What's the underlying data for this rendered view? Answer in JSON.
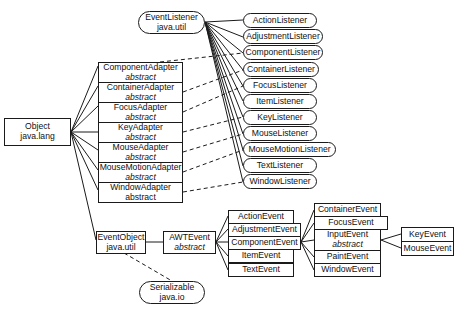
{
  "diagram": {
    "root": {
      "name": "Object",
      "package": "java.lang"
    },
    "event_listener": {
      "name": "EventListener",
      "package": "java.util"
    },
    "event_object": {
      "name": "EventObject",
      "package": "java.util"
    },
    "serializable": {
      "name": "Serializable",
      "package": "java.io"
    },
    "awt_event": {
      "name": "AWTEvent",
      "modifier": "abstract"
    },
    "adapters": [
      {
        "name": "ComponentAdapter",
        "modifier": "abstract"
      },
      {
        "name": "ContainerAdapter",
        "modifier": "abstract"
      },
      {
        "name": "FocusAdapter",
        "modifier": "abstract"
      },
      {
        "name": "KeyAdapter",
        "modifier": "abstract"
      },
      {
        "name": "MouseAdapter",
        "modifier": "abstract"
      },
      {
        "name": "MouseMotionAdapter",
        "modifier": "abstract"
      },
      {
        "name": "WindowAdapter",
        "modifier": "abstract"
      }
    ],
    "listeners": [
      "ActionListener",
      "AdjustmentListener",
      "ComponentListener",
      "ContainerListener",
      "FocusListener",
      "ItemListener",
      "KeyListener",
      "MouseListener",
      "MouseMotionListener",
      "TextListener",
      "WindowListener"
    ],
    "awt_events": [
      "ActionEvent",
      "AdjustmentEvent",
      "ComponentEvent",
      "ItemEvent",
      "TextEvent"
    ],
    "component_events": [
      {
        "name": "ContainerEvent"
      },
      {
        "name": "FocusEvent"
      },
      {
        "name": "InputEvent",
        "modifier": "abstract"
      },
      {
        "name": "PaintEvent"
      },
      {
        "name": "WindowEvent"
      }
    ],
    "input_events": [
      "KeyEvent",
      "MouseEvent"
    ],
    "legend": {
      "solid_line": "extends",
      "dashed_line": "implements"
    }
  }
}
